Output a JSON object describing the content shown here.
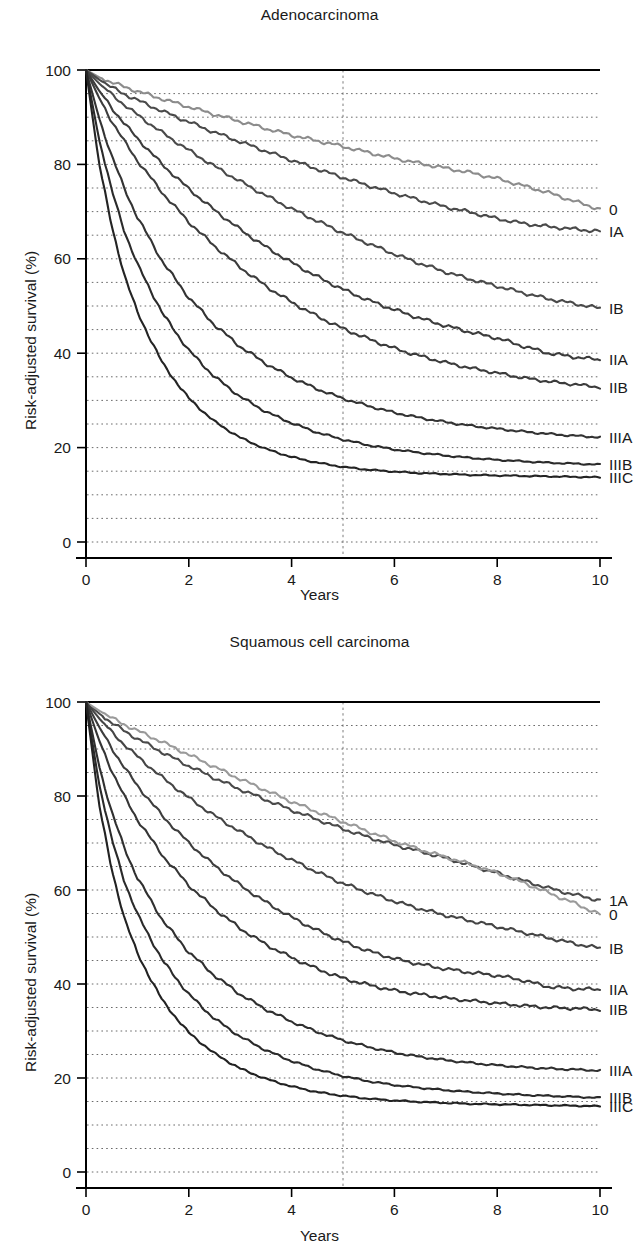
{
  "figure": {
    "y_axis_label": "Risk-adjusted survival (%)",
    "x_axis_label": "Years"
  },
  "panels": {
    "adeno": {
      "title": "Adenocarcinoma",
      "y_ticks": [
        "0",
        "20",
        "40",
        "60",
        "80",
        "100"
      ],
      "x_ticks": [
        "0",
        "2",
        "4",
        "6",
        "8",
        "10"
      ]
    },
    "squamous": {
      "title": "Squamous cell carcinoma",
      "y_ticks": [
        "0",
        "20",
        "40",
        "60",
        "80",
        "100"
      ],
      "x_ticks": [
        "0",
        "2",
        "4",
        "6",
        "8",
        "10"
      ]
    }
  },
  "chart_data": [
    {
      "type": "line",
      "id": "adenocarcinoma",
      "title": "Adenocarcinoma",
      "xlabel": "Years",
      "ylabel": "Risk-adjusted survival (%)",
      "xlim": [
        0,
        10
      ],
      "ylim": [
        0,
        100
      ],
      "x_ticks": [
        0,
        2,
        4,
        6,
        8,
        10
      ],
      "y_ticks": [
        0,
        20,
        40,
        60,
        80,
        100
      ],
      "grid": "horizontal dotted every 5 units",
      "reference_line_x": 5,
      "legend": "inline right-edge labels",
      "x": [
        0,
        0.25,
        0.5,
        0.75,
        1,
        1.5,
        2,
        2.5,
        3,
        3.5,
        4,
        4.5,
        5,
        5.5,
        6,
        6.5,
        7,
        7.5,
        8,
        8.5,
        9,
        9.5,
        10
      ],
      "series": [
        {
          "name": "0",
          "color": "#8c8c8c",
          "values": [
            100,
            98.5,
            97.4,
            96.4,
            95.5,
            93.8,
            92.2,
            90.6,
            89.1,
            87.6,
            86.2,
            85.0,
            83.8,
            82.5,
            81.3,
            80.2,
            79.2,
            78.2,
            77.0,
            75.5,
            74.0,
            72.2,
            70.5
          ]
        },
        {
          "name": "IA",
          "color": "#4a4a4a",
          "values": [
            100,
            98.0,
            96.3,
            94.9,
            93.6,
            91.2,
            89.0,
            86.8,
            84.8,
            82.8,
            80.9,
            79.0,
            77.2,
            75.5,
            73.9,
            72.4,
            71.0,
            69.8,
            68.5,
            67.5,
            66.8,
            66.3,
            65.8
          ]
        },
        {
          "name": "IB",
          "color": "#4a4a4a",
          "values": [
            100,
            97.2,
            94.8,
            92.6,
            90.5,
            86.6,
            83.0,
            79.6,
            76.4,
            73.4,
            70.6,
            68.0,
            65.5,
            63.2,
            61.0,
            59.0,
            57.2,
            55.6,
            54.2,
            52.8,
            51.5,
            50.5,
            49.5
          ]
        },
        {
          "name": "IIA",
          "color": "#3c3c3c",
          "values": [
            100,
            95.7,
            92.0,
            88.6,
            85.5,
            79.8,
            74.8,
            70.3,
            66.2,
            62.5,
            59.2,
            56.2,
            53.5,
            51.2,
            49.2,
            47.4,
            45.8,
            44.4,
            43.2,
            41.5,
            40.0,
            39.2,
            38.6
          ]
        },
        {
          "name": "IIB",
          "color": "#3c3c3c",
          "values": [
            100,
            94.2,
            89.2,
            84.8,
            80.8,
            73.8,
            67.8,
            62.7,
            58.2,
            54.2,
            50.8,
            47.8,
            45.2,
            43.0,
            41.0,
            39.4,
            38.0,
            36.8,
            35.8,
            34.8,
            34.0,
            33.4,
            32.8
          ]
        },
        {
          "name": "IIIA",
          "color": "#333333",
          "values": [
            100,
            90.0,
            81.8,
            74.8,
            68.8,
            59.2,
            51.8,
            46.0,
            41.4,
            37.8,
            34.8,
            32.4,
            30.4,
            28.8,
            27.4,
            26.3,
            25.4,
            24.6,
            24.0,
            23.4,
            22.9,
            22.5,
            22.2
          ]
        },
        {
          "name": "IIIB",
          "color": "#2b2b2b",
          "values": [
            100,
            85.5,
            74.5,
            65.8,
            58.8,
            48.2,
            40.6,
            35.0,
            30.8,
            27.6,
            25.2,
            23.2,
            21.7,
            20.5,
            19.6,
            18.9,
            18.3,
            17.8,
            17.4,
            17.1,
            16.8,
            16.6,
            16.4
          ]
        },
        {
          "name": "IIIC",
          "color": "#242424",
          "values": [
            100,
            80.5,
            66.8,
            56.5,
            48.6,
            37.6,
            30.4,
            25.5,
            22.1,
            19.7,
            18.0,
            16.8,
            15.9,
            15.3,
            14.9,
            14.6,
            14.4,
            14.2,
            14.1,
            14.0,
            13.9,
            13.8,
            13.7
          ]
        }
      ]
    },
    {
      "type": "line",
      "id": "squamous-cell-carcinoma",
      "title": "Squamous cell carcinoma",
      "xlabel": "Years",
      "ylabel": "Risk-adjusted survival (%)",
      "xlim": [
        0,
        10
      ],
      "ylim": [
        0,
        100
      ],
      "x_ticks": [
        0,
        2,
        4,
        6,
        8,
        10
      ],
      "y_ticks": [
        0,
        20,
        40,
        60,
        80,
        100
      ],
      "grid": "horizontal dotted every 5 units",
      "reference_line_x": 5,
      "legend": "inline right-edge labels",
      "x": [
        0,
        0.25,
        0.5,
        0.75,
        1,
        1.5,
        2,
        2.5,
        3,
        3.5,
        4,
        4.5,
        5,
        5.5,
        6,
        6.5,
        7,
        7.5,
        8,
        8.5,
        9,
        9.5,
        10
      ],
      "series": [
        {
          "name": "1A",
          "color": "#4a4a4a",
          "values": [
            100,
            97.6,
            95.6,
            93.8,
            92.2,
            89.2,
            86.4,
            83.8,
            81.4,
            79.2,
            77.0,
            75.0,
            73.0,
            71.2,
            69.6,
            68.2,
            66.8,
            65.2,
            63.6,
            62.0,
            60.4,
            59.0,
            57.8
          ]
        },
        {
          "name": "0",
          "color": "#9a9a9a",
          "values": [
            100,
            98.2,
            96.6,
            95.2,
            93.9,
            91.4,
            88.8,
            86.2,
            83.6,
            81.2,
            78.8,
            76.6,
            74.5,
            72.4,
            70.4,
            68.6,
            67.0,
            65.4,
            63.6,
            61.6,
            59.4,
            57.2,
            54.8
          ]
        },
        {
          "name": "IB",
          "color": "#454545",
          "values": [
            100,
            96.6,
            93.6,
            90.9,
            88.4,
            83.8,
            79.6,
            75.8,
            72.4,
            69.2,
            66.4,
            63.8,
            61.4,
            59.4,
            57.6,
            56.0,
            54.6,
            53.4,
            52.2,
            51.0,
            49.8,
            48.6,
            47.6
          ]
        },
        {
          "name": "IIA",
          "color": "#3d3d3d",
          "values": [
            100,
            94.8,
            90.2,
            86.0,
            82.2,
            75.6,
            70.0,
            65.2,
            61.0,
            57.4,
            54.2,
            51.4,
            49.0,
            47.0,
            45.4,
            44.2,
            43.2,
            42.4,
            41.8,
            40.8,
            39.4,
            39.0,
            38.8
          ]
        },
        {
          "name": "IIB",
          "color": "#353535",
          "values": [
            100,
            92.0,
            85.4,
            79.8,
            75.0,
            67.2,
            61.0,
            56.0,
            51.8,
            48.4,
            45.6,
            43.2,
            41.2,
            39.8,
            38.6,
            37.8,
            37.0,
            36.4,
            35.9,
            35.4,
            35.0,
            34.8,
            34.6
          ]
        },
        {
          "name": "IIIA",
          "color": "#303030",
          "values": [
            100,
            86.6,
            76.6,
            68.8,
            62.6,
            53.4,
            46.8,
            41.8,
            37.8,
            34.6,
            32.0,
            29.8,
            28.0,
            26.6,
            25.4,
            24.5,
            23.8,
            23.2,
            22.7,
            22.3,
            22.0,
            21.8,
            21.6
          ]
        },
        {
          "name": "IIIB",
          "color": "#2a2a2a",
          "values": [
            100,
            82.8,
            70.8,
            61.8,
            54.8,
            44.8,
            37.8,
            32.6,
            28.8,
            25.9,
            23.6,
            21.8,
            20.4,
            19.3,
            18.5,
            17.9,
            17.4,
            17.0,
            16.7,
            16.4,
            16.2,
            16.0,
            15.8
          ]
        },
        {
          "name": "IIIC",
          "color": "#222222",
          "values": [
            100,
            78.5,
            64.2,
            54.0,
            46.4,
            36.2,
            29.6,
            25.2,
            22.0,
            19.8,
            18.2,
            17.0,
            16.2,
            15.6,
            15.2,
            14.9,
            14.7,
            14.5,
            14.4,
            14.3,
            14.2,
            14.1,
            14.0
          ]
        }
      ]
    }
  ]
}
